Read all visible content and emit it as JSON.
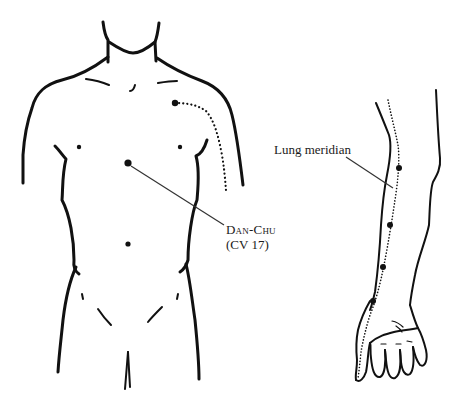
{
  "diagram": {
    "type": "anatomical acupuncture illustration",
    "ink_color": "#111111",
    "background": "#ffffff"
  },
  "labels": {
    "lung_meridian": "Lung meridian",
    "dan_chu_name": "Dan-Chu",
    "dan_chu_code": "(CV 17)"
  },
  "figures": {
    "torso": {
      "description": "Front view of male torso",
      "points": [
        {
          "name": "Dan-Chu (CV 17)",
          "x": 128,
          "y": 163
        },
        {
          "name": "shoulder-point",
          "x": 175,
          "y": 103
        }
      ]
    },
    "arm": {
      "description": "Inner (palm-side) view of left arm and hand",
      "meridian": "Lung meridian",
      "points": [
        {
          "x": 399,
          "y": 168
        },
        {
          "x": 390,
          "y": 225
        },
        {
          "x": 383,
          "y": 267
        },
        {
          "x": 373,
          "y": 301
        }
      ]
    }
  }
}
